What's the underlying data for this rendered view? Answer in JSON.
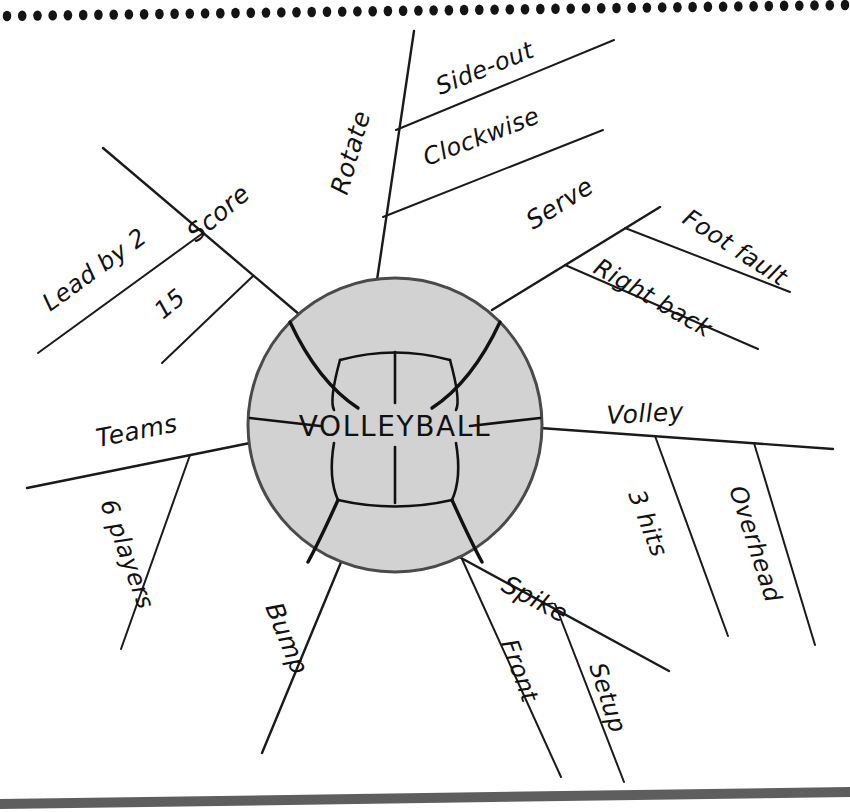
{
  "page": {
    "background_color": "#ffffff",
    "ink_color": "#111111",
    "top_border": {
      "style": "dotted-spiral-row",
      "dot_count": 56,
      "dot_color": "#141414"
    },
    "bottom_border": {
      "style": "page-edge-shadow",
      "color": "#5e5e5e"
    }
  },
  "center": {
    "label": "VOLLEYBALL",
    "shape": "volleyball",
    "fill_color": "#d2d2d2",
    "outline_color": "#4a4a4a",
    "cx": 395,
    "cy": 425,
    "r": 147
  },
  "chart_data": {
    "type": "mind-map",
    "title": "VOLLEYBALL",
    "center_label": "VOLLEYBALL",
    "branch_count": 7,
    "branches": [
      {
        "label": "Score",
        "angle_deg": 215,
        "children": [
          "Lead by 2",
          "15"
        ]
      },
      {
        "label": "Rotate",
        "angle_deg": 285,
        "children": [
          "Side-out",
          "Clockwise"
        ]
      },
      {
        "label": "Serve",
        "angle_deg": 330,
        "children": [
          "Foot fault",
          "Right back"
        ]
      },
      {
        "label": "Volley",
        "angle_deg": 2,
        "children": [
          "3 hits",
          "Overhead"
        ]
      },
      {
        "label": "Spike",
        "angle_deg": 40,
        "children": [
          "Front",
          "Setup"
        ]
      },
      {
        "label": "Bump",
        "angle_deg": 105,
        "children": []
      },
      {
        "label": "Teams",
        "angle_deg": 182,
        "children": [
          "6 players"
        ]
      }
    ]
  },
  "branches": {
    "score": {
      "label": "Score",
      "sub1": "Lead by 2",
      "sub2": "15"
    },
    "rotate": {
      "label": "Rotate",
      "sub1": "Side-out",
      "sub2": "Clockwise"
    },
    "serve": {
      "label": "Serve",
      "sub1": "Foot fault",
      "sub2": "Right back"
    },
    "volley": {
      "label": "Volley",
      "sub1": "3 hits",
      "sub2": "Overhead"
    },
    "spike": {
      "label": "Spike",
      "sub1": "Front",
      "sub2": "Setup"
    },
    "bump": {
      "label": "Bump"
    },
    "teams": {
      "label": "Teams",
      "sub1": "6 players"
    }
  }
}
